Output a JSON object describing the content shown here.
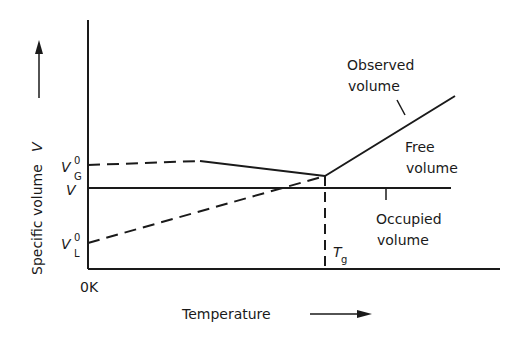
{
  "axes": {
    "y_label": "Specific volume",
    "y_symbol": "V",
    "x_label": "Temperature",
    "origin_label": "0K"
  },
  "y_ticks": [
    {
      "symbol": "V",
      "sup": "0",
      "sub": "G"
    },
    {
      "symbol": "V",
      "sup": "",
      "sub": ""
    },
    {
      "symbol": "V",
      "sup": "0",
      "sub": "L"
    }
  ],
  "tg": {
    "symbol": "T",
    "sub": "g"
  },
  "annotations": {
    "observed_1": "Observed",
    "observed_2": "volume",
    "free_1": "Free",
    "free_2": "volume",
    "occupied_1": "Occupied",
    "occupied_2": "volume"
  }
}
